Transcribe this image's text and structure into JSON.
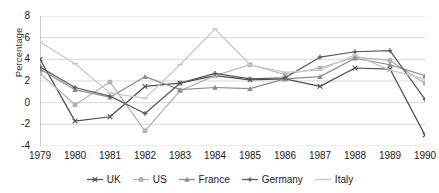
{
  "chart_data": {
    "type": "line",
    "title": "",
    "xlabel": "",
    "ylabel": "Percentage",
    "categories": [
      "1979",
      "1980",
      "1981",
      "1982",
      "1983",
      "1984",
      "1985",
      "1986",
      "1987",
      "1988",
      "1989",
      "1990"
    ],
    "xlim": [
      1979,
      1990
    ],
    "ylim": [
      -4,
      8
    ],
    "yticks": [
      8,
      6,
      4,
      2,
      0,
      -2,
      -4
    ],
    "grid": "horizontal",
    "legend_position": "bottom",
    "series": [
      {
        "name": "UK",
        "color": "#4d4d4d",
        "marker": "x",
        "values": [
          4.0,
          -1.7,
          -1.3,
          1.5,
          1.8,
          2.5,
          2.1,
          2.2,
          1.5,
          3.2,
          3.1,
          -3.0
        ]
      },
      {
        "name": "US",
        "color": "#b3b3b3",
        "marker": "square",
        "values": [
          2.7,
          -0.2,
          1.9,
          -2.6,
          1.1,
          2.5,
          3.5,
          2.6,
          3.2,
          4.2,
          3.9,
          1.8
        ]
      },
      {
        "name": "France",
        "color": "#8c8c8c",
        "marker": "triangle",
        "values": [
          3.1,
          1.2,
          0.5,
          2.4,
          1.2,
          1.4,
          1.3,
          2.2,
          2.4,
          4.1,
          3.5,
          2.5
        ]
      },
      {
        "name": "Germany",
        "color": "#595959",
        "marker": "plus",
        "values": [
          3.3,
          1.4,
          0.6,
          -1.0,
          1.8,
          2.7,
          2.2,
          2.3,
          4.2,
          4.7,
          4.8,
          0.3
        ]
      },
      {
        "name": "Italy",
        "color": "#c9c9c9",
        "marker": "dash",
        "values": [
          5.6,
          3.6,
          0.9,
          0.4,
          3.5,
          6.8,
          3.5,
          2.8,
          3.0,
          4.4,
          3.0,
          2.2
        ]
      }
    ]
  },
  "legend": {
    "items": [
      {
        "label": "UK"
      },
      {
        "label": "US"
      },
      {
        "label": "France"
      },
      {
        "label": "Germany"
      },
      {
        "label": "Italy"
      }
    ]
  },
  "axis": {
    "y_title": "Percentage",
    "y_tick_labels": [
      "8",
      "6",
      "4",
      "2",
      "0",
      "-2",
      "-4"
    ],
    "x_tick_labels": [
      "1979",
      "1980",
      "1981",
      "1982",
      "1983",
      "1984",
      "1985",
      "1986",
      "1987",
      "1988",
      "1989",
      "1990"
    ]
  }
}
